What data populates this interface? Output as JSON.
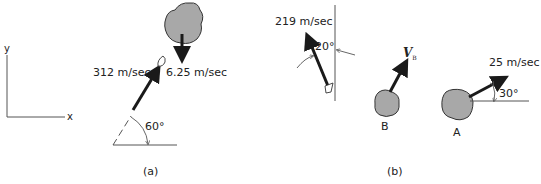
{
  "panel_a": {
    "caption": "(a)",
    "axes": {
      "y_label": "y",
      "x_label": "x"
    },
    "projectile": {
      "speed_label": "312 m/sec",
      "angle_label": "60°"
    },
    "rock": {
      "speed_label": "6.25 m/sec",
      "direction": "down"
    }
  },
  "panel_b": {
    "caption": "(b)",
    "projectile": {
      "speed_label": "219 m/sec",
      "angle_label": "20°"
    },
    "rock_b": {
      "label": "B",
      "velocity_symbol": "V",
      "velocity_subscript": "B"
    },
    "rock_a": {
      "label": "A",
      "speed_label": "25 m/sec",
      "angle_label": "30°"
    }
  },
  "colors": {
    "rock_fill": "#a8a8a8",
    "rock_stroke": "#333333",
    "arrow": "#1a1a1a",
    "line": "#555555"
  }
}
